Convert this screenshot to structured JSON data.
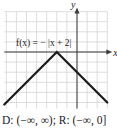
{
  "chart_data": {
    "type": "line",
    "title": "",
    "function_label": "f(x) = − |x + 2|",
    "xlabel": "x",
    "ylabel": "y",
    "xlim": [
      -7,
      3
    ],
    "ylim": [
      -5.6,
      4
    ],
    "grid": true,
    "series": [
      {
        "name": "f(x) = −|x + 2|",
        "points": [
          [
            -7.2,
            -5.2
          ],
          [
            -2,
            0
          ],
          [
            3,
            -5
          ]
        ]
      }
    ],
    "vertex": [
      -2,
      0
    ]
  },
  "caption": "D: (−∞, ∞); R: (−∞, 0]"
}
